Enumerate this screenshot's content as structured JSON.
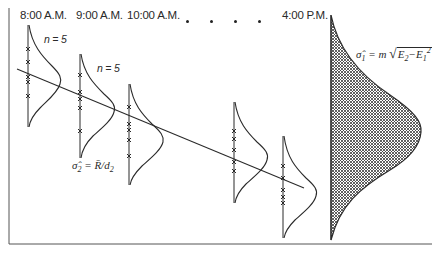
{
  "time_labels": [
    {
      "label": "8:00 A.M.",
      "x": 20
    },
    {
      "label": "9:00 A.M.",
      "x": 76
    },
    {
      "label": "10:00 A.M.",
      "x": 127
    },
    {
      "label": "4:00 P.M.",
      "x": 282
    }
  ],
  "ellipsis_dots_x": [
    187,
    211,
    235,
    259
  ],
  "sample_size_labels": [
    {
      "text": "n = 5",
      "x": 44,
      "y": 38
    },
    {
      "text": "n = 5",
      "x": 97,
      "y": 67
    }
  ],
  "within_formula": {
    "lhs": "σ̂",
    "lhs_sub": "2",
    "eq": " = ",
    "rbar": "R̄",
    "slash": "/",
    "d": "d",
    "d_sub": "2"
  },
  "total_formula": {
    "lhs": "σ̂",
    "lhs_sub": "1",
    "eq": " = ",
    "m": "m",
    "e2": "E",
    "e2_sub": "2",
    "minus": "−",
    "e1": "E",
    "e1_sub": "1",
    "e1_sup": "2"
  },
  "subgroups": [
    {
      "time": "8:00 A.M.",
      "axis_x": 28,
      "y_top": 25,
      "y_bottom": 127,
      "peak_x": 60,
      "peak_y": 80,
      "samples_y": [
        49,
        62,
        77,
        82,
        96
      ]
    },
    {
      "time": "9:00 A.M.",
      "axis_x": 80,
      "y_top": 54,
      "y_bottom": 158,
      "peak_x": 115,
      "peak_y": 108,
      "samples_y": [
        75,
        92,
        99,
        108,
        131
      ]
    },
    {
      "time": "10:00 A.M.",
      "axis_x": 129,
      "y_top": 84,
      "y_bottom": 185,
      "peak_x": 163,
      "peak_y": 140,
      "samples_y": [
        107,
        124,
        130,
        140,
        156
      ]
    },
    {
      "time": "…",
      "axis_x": 234,
      "y_top": 102,
      "y_bottom": 203,
      "peak_x": 267,
      "peak_y": 153,
      "samples_y": [
        131,
        139,
        150,
        162,
        171
      ]
    },
    {
      "time": "4:00 P.M.",
      "axis_x": 283,
      "y_top": 136,
      "y_bottom": 238,
      "peak_x": 316,
      "peak_y": 192,
      "samples_y": [
        166,
        178,
        190,
        197,
        203
      ]
    }
  ],
  "trend_line": {
    "x1": 17,
    "y1": 69,
    "x2": 304,
    "y2": 188
  },
  "total_distribution": {
    "axis_x": 331,
    "y_top": 15,
    "y_bottom": 240,
    "peak_x": 421,
    "peak_y": 130
  },
  "colors": {
    "ink": "#2a2a2a",
    "background": "#ffffff",
    "hatch": "#3a3a3a"
  }
}
